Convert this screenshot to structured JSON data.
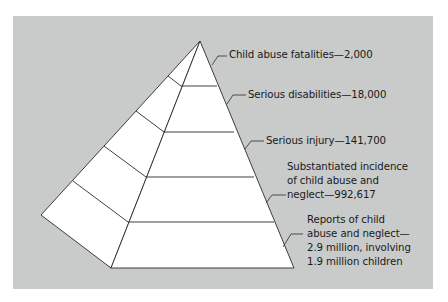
{
  "diagram": {
    "type": "pyramid",
    "levels": [
      {
        "id": "fatalities",
        "lines": [
          "Child abuse fatalities—2,000"
        ],
        "category": "Child abuse fatalities",
        "value": "2,000"
      },
      {
        "id": "disabilities",
        "lines": [
          "Serious disabilities—18,000"
        ],
        "category": "Serious disabilities",
        "value": "18,000"
      },
      {
        "id": "injury",
        "lines": [
          "Serious injury—141,700"
        ],
        "category": "Serious injury",
        "value": "141,700"
      },
      {
        "id": "substantiated",
        "lines": [
          "Substantiated incidence",
          "of child abuse and",
          "neglect—992,617"
        ],
        "category": "Substantiated incidence of child abuse and neglect",
        "value": "992,617"
      },
      {
        "id": "reports",
        "lines": [
          "Reports of child",
          "abuse and neglect—",
          "2.9 million, involving",
          "1.9 million children"
        ],
        "category": "Reports of child abuse and neglect",
        "value": "2.9 million, involving 1.9 million children"
      }
    ]
  },
  "colors": {
    "background": "#c9caca",
    "face": "#ffffff",
    "stroke": "#2b2b2b",
    "text": "#1a1a1a"
  }
}
